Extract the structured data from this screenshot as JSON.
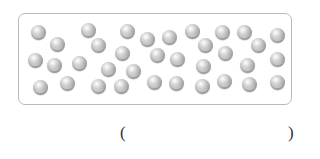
{
  "figure": {
    "frame": {
      "border_color": "#b9b9b9",
      "background": "#ffffff"
    },
    "marble": {
      "icon": "marble-icon",
      "color": "#a8a8a8",
      "count": 35
    },
    "marbles": [
      {
        "x": 38,
        "y": 32
      },
      {
        "x": 57,
        "y": 44
      },
      {
        "x": 35,
        "y": 60
      },
      {
        "x": 54,
        "y": 65
      },
      {
        "x": 40,
        "y": 87
      },
      {
        "x": 67,
        "y": 83
      },
      {
        "x": 79,
        "y": 63
      },
      {
        "x": 88,
        "y": 30
      },
      {
        "x": 98,
        "y": 45
      },
      {
        "x": 108,
        "y": 69
      },
      {
        "x": 98,
        "y": 86
      },
      {
        "x": 127,
        "y": 31
      },
      {
        "x": 122,
        "y": 53
      },
      {
        "x": 121,
        "y": 86
      },
      {
        "x": 133,
        "y": 71
      },
      {
        "x": 147,
        "y": 39
      },
      {
        "x": 169,
        "y": 37
      },
      {
        "x": 157,
        "y": 55
      },
      {
        "x": 177,
        "y": 59
      },
      {
        "x": 154,
        "y": 82
      },
      {
        "x": 176,
        "y": 83
      },
      {
        "x": 192,
        "y": 31
      },
      {
        "x": 205,
        "y": 45
      },
      {
        "x": 222,
        "y": 32
      },
      {
        "x": 225,
        "y": 53
      },
      {
        "x": 203,
        "y": 66
      },
      {
        "x": 202,
        "y": 86
      },
      {
        "x": 224,
        "y": 81
      },
      {
        "x": 244,
        "y": 32
      },
      {
        "x": 258,
        "y": 45
      },
      {
        "x": 247,
        "y": 65
      },
      {
        "x": 249,
        "y": 84
      },
      {
        "x": 277,
        "y": 35
      },
      {
        "x": 277,
        "y": 59
      },
      {
        "x": 277,
        "y": 82
      }
    ]
  },
  "answer": {
    "open_paren": "(",
    "close_paren": ")",
    "value": ""
  }
}
